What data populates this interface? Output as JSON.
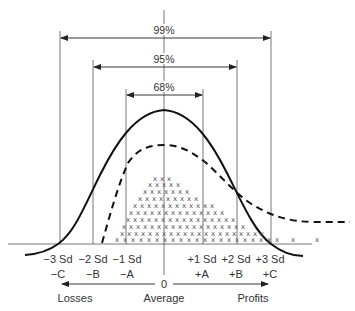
{
  "diagram": {
    "intervals": [
      {
        "label": "99%",
        "from": "-3 Sd",
        "to": "+3 Sd"
      },
      {
        "label": "95%",
        "from": "-2 Sd",
        "to": "+2 Sd"
      },
      {
        "label": "68%",
        "from": "-1 Sd",
        "to": "+1 Sd"
      }
    ],
    "sd_labels": {
      "neg3": "−3 Sd",
      "neg2": "−2 Sd",
      "neg1": "−1 Sd",
      "pos1": "+1 Sd",
      "pos2": "+2 Sd",
      "pos3": "+3 Sd"
    },
    "letter_labels": {
      "negC": "−C",
      "negB": "−B",
      "negA": "−A",
      "posA": "+A",
      "posB": "+B",
      "posC": "+C"
    },
    "axis": {
      "zero": "0",
      "left": "Losses",
      "center": "Average",
      "right": "Profits"
    },
    "curves": [
      {
        "name": "normal-curve",
        "style": "solid"
      },
      {
        "name": "skewed-curve",
        "style": "dashed"
      },
      {
        "name": "observed-data",
        "style": "x-markers"
      }
    ],
    "colors": {
      "line": "#1a1a1a",
      "text": "#333333",
      "thin": "#555555"
    }
  }
}
